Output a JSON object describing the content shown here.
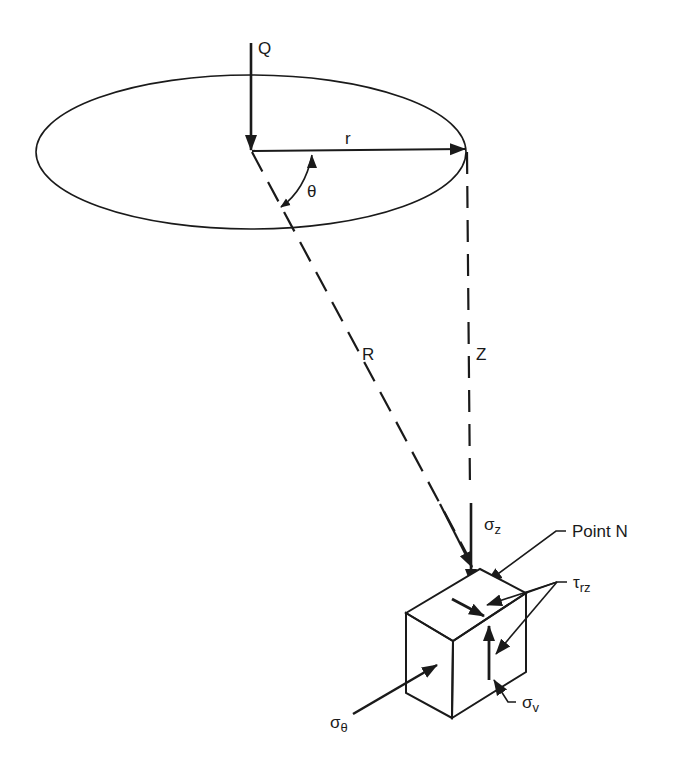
{
  "diagram": {
    "colors": {
      "line": "#1a1a1a",
      "background": "#ffffff"
    },
    "labels": {
      "load": "Q",
      "radius": "r",
      "angle": "θ",
      "distance": "R",
      "depth": "Z",
      "vertical_stress": "σ",
      "vertical_stress_sub": "z",
      "point": "Point N",
      "shear_stress": "τ",
      "shear_stress_sub": "rz",
      "tangential_stress": "σ",
      "tangential_stress_sub": "θ",
      "radial_stress": "σ",
      "radial_stress_sub": "v"
    }
  }
}
